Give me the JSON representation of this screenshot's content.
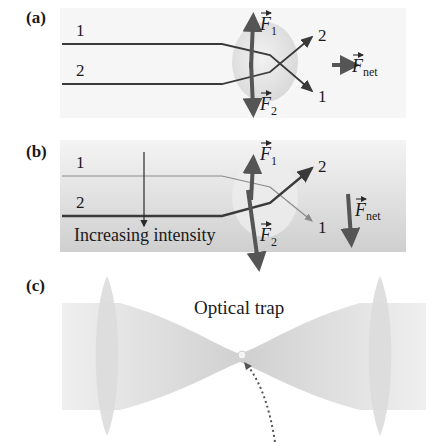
{
  "panels": {
    "a": {
      "label": "(a)",
      "ray1": "1",
      "ray2": "2",
      "out_ray1": "1",
      "out_ray2": "2",
      "force1": "F",
      "force1_sub": "1",
      "force2": "F",
      "force2_sub": "2",
      "fnet": "F",
      "fnet_sub": "net"
    },
    "b": {
      "label": "(b)",
      "ray1": "1",
      "ray2": "2",
      "out_ray1": "1",
      "out_ray2": "2",
      "force1": "F",
      "force1_sub": "1",
      "force2": "F",
      "force2_sub": "2",
      "fnet": "F",
      "fnet_sub": "net",
      "gradient_label": "Increasing intensity"
    },
    "c": {
      "label": "(c)",
      "title": "Optical trap"
    }
  },
  "colors": {
    "ray": "#3a3a3a",
    "force_arrow": "#555555",
    "beam": "#d6d6d6",
    "sphere": "#e3e3e3"
  }
}
